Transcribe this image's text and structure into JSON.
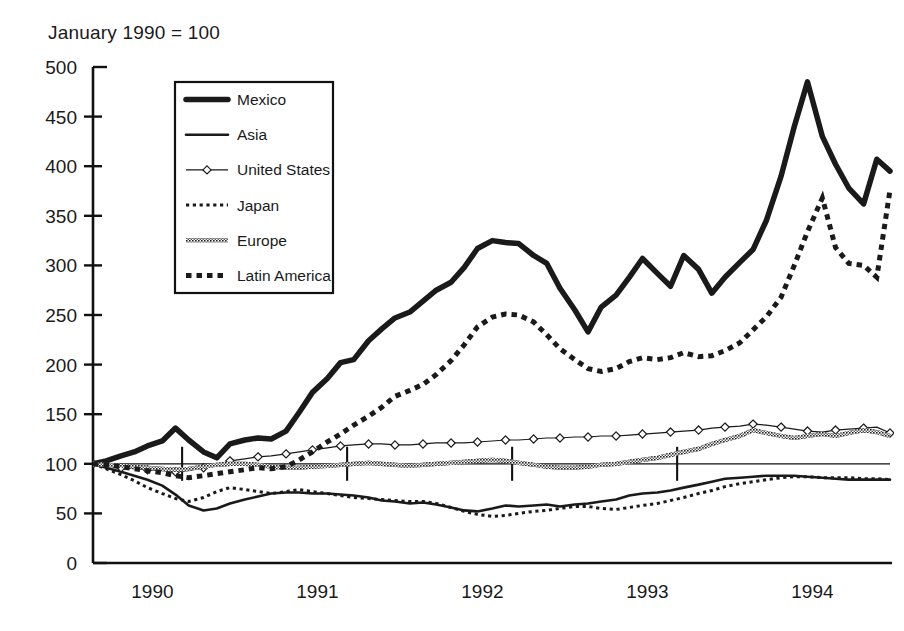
{
  "figure": {
    "note": "January 1990 = 100",
    "background": "#ffffff",
    "ink": "#111111"
  },
  "chart_data": {
    "type": "line",
    "title": "",
    "subtitle": "",
    "annotations": [
      "January 1990 = 100"
    ],
    "xlabel": "",
    "ylabel": "",
    "xlim": [
      1989.96,
      1994.79
    ],
    "ylim": [
      0,
      500
    ],
    "ytick_step": 50,
    "yticks": [
      0,
      50,
      100,
      150,
      200,
      250,
      300,
      350,
      400,
      450,
      500
    ],
    "ytick_labels": [
      "0",
      "50",
      "100",
      "150",
      "200",
      "250",
      "300",
      "350",
      "400",
      "450",
      "500"
    ],
    "xticks": [
      1990,
      1991,
      1992,
      1993,
      1994
    ],
    "xtick_labels": [
      "1990",
      "1991",
      "1992",
      "1993",
      "1994"
    ],
    "grid": false,
    "reference_line_y": 100,
    "reference_tick_x": [
      1990.5,
      1991.5,
      1992.5,
      1993.5
    ],
    "legend_position": "upper-left-inside",
    "x": [
      1989.96,
      1990.04,
      1990.13,
      1990.21,
      1990.29,
      1990.38,
      1990.46,
      1990.54,
      1990.63,
      1990.71,
      1990.79,
      1990.88,
      1990.96,
      1991.04,
      1991.13,
      1991.21,
      1991.29,
      1991.38,
      1991.46,
      1991.54,
      1991.63,
      1991.71,
      1991.79,
      1991.88,
      1991.96,
      1992.04,
      1992.13,
      1992.21,
      1992.29,
      1992.38,
      1992.46,
      1992.54,
      1992.63,
      1992.71,
      1992.79,
      1992.88,
      1992.96,
      1993.04,
      1993.13,
      1993.21,
      1993.29,
      1993.38,
      1993.46,
      1993.54,
      1993.63,
      1993.71,
      1993.79,
      1993.88,
      1993.96,
      1994.04,
      1994.13,
      1994.21,
      1994.29,
      1994.38,
      1994.46,
      1994.54,
      1994.63,
      1994.71,
      1994.79
    ],
    "series": [
      {
        "name": "Mexico",
        "style": "thick-solid",
        "linewidth": 5.5,
        "color": "#1a1a1a",
        "values": [
          100,
          103,
          108,
          112,
          118,
          123,
          136,
          124,
          112,
          106,
          120,
          124,
          126,
          125,
          133,
          152,
          172,
          186,
          202,
          205,
          224,
          236,
          247,
          253,
          264,
          275,
          283,
          298,
          317,
          325,
          323,
          322,
          310,
          302,
          277,
          255,
          233,
          258,
          270,
          288,
          307,
          292,
          279,
          310,
          296,
          272,
          288,
          303,
          316,
          345,
          390,
          440,
          485,
          430,
          402,
          378,
          362,
          407,
          395
        ]
      },
      {
        "name": "Asia",
        "style": "medium-solid",
        "linewidth": 2.6,
        "color": "#1a1a1a",
        "values": [
          100,
          96,
          92,
          88,
          84,
          78,
          69,
          58,
          53,
          55,
          60,
          64,
          67,
          70,
          71,
          71,
          70,
          70,
          69,
          68,
          66,
          63,
          62,
          60,
          61,
          59,
          56,
          53,
          52,
          55,
          58,
          57,
          58,
          59,
          57,
          59,
          60,
          62,
          64,
          68,
          70,
          71,
          73,
          76,
          79,
          82,
          85,
          86,
          87,
          88,
          88,
          88,
          87,
          86,
          85,
          84,
          84,
          84,
          84
        ]
      },
      {
        "name": "United States",
        "style": "thin-marker",
        "linewidth": 1.2,
        "color": "#1a1a1a",
        "marker": "diamond-open",
        "values": [
          100,
          98,
          96,
          95,
          94,
          93,
          92,
          93,
          96,
          99,
          103,
          105,
          107,
          108,
          110,
          112,
          114,
          116,
          118,
          119,
          120,
          120,
          119,
          119,
          120,
          121,
          121,
          121,
          122,
          123,
          124,
          124,
          125,
          126,
          126,
          127,
          127,
          128,
          128,
          129,
          130,
          131,
          132,
          133,
          134,
          136,
          137,
          138,
          140,
          139,
          137,
          135,
          133,
          132,
          134,
          135,
          136,
          137,
          131
        ]
      },
      {
        "name": "Japan",
        "style": "fine-dotted",
        "linewidth": 3.0,
        "color": "#1a1a1a",
        "values": [
          100,
          95,
          89,
          83,
          76,
          70,
          65,
          62,
          66,
          72,
          76,
          74,
          72,
          70,
          72,
          74,
          72,
          70,
          68,
          66,
          65,
          64,
          63,
          62,
          62,
          60,
          56,
          52,
          49,
          47,
          48,
          50,
          52,
          53,
          55,
          57,
          57,
          55,
          54,
          56,
          58,
          60,
          63,
          66,
          70,
          73,
          77,
          80,
          82,
          84,
          86,
          87,
          87,
          86,
          86,
          86,
          85,
          85,
          84
        ]
      },
      {
        "name": "Europe",
        "style": "hatched-medium",
        "linewidth": 4.2,
        "color": "#3a3a3a",
        "values": [
          100,
          99,
          98,
          97,
          96,
          95,
          94,
          95,
          97,
          99,
          100,
          100,
          99,
          97,
          96,
          96,
          97,
          98,
          99,
          100,
          101,
          100,
          99,
          98,
          99,
          100,
          101,
          102,
          103,
          104,
          103,
          101,
          99,
          97,
          96,
          96,
          97,
          99,
          100,
          102,
          104,
          106,
          109,
          112,
          115,
          120,
          124,
          128,
          134,
          131,
          128,
          126,
          128,
          130,
          128,
          131,
          134,
          132,
          128
        ]
      },
      {
        "name": "Latin America",
        "style": "thick-dashed",
        "linewidth": 5.0,
        "color": "#1a1a1a",
        "values": [
          100,
          99,
          97,
          95,
          93,
          91,
          88,
          86,
          88,
          90,
          92,
          94,
          96,
          95,
          97,
          104,
          112,
          122,
          130,
          139,
          148,
          157,
          168,
          174,
          180,
          190,
          204,
          220,
          238,
          248,
          251,
          250,
          243,
          230,
          216,
          205,
          196,
          193,
          196,
          203,
          207,
          205,
          207,
          212,
          208,
          209,
          214,
          222,
          235,
          248,
          268,
          300,
          334,
          368,
          318,
          302,
          300,
          288,
          376
        ]
      }
    ]
  },
  "legend": {
    "items": [
      {
        "label": "Mexico",
        "sample": "thick-solid"
      },
      {
        "label": "Asia",
        "sample": "medium-solid"
      },
      {
        "label": "United States",
        "sample": "thin-marker"
      },
      {
        "label": "Japan",
        "sample": "fine-dotted"
      },
      {
        "label": "Europe",
        "sample": "hatched-medium"
      },
      {
        "label": "Latin America",
        "sample": "thick-dashed"
      }
    ]
  }
}
